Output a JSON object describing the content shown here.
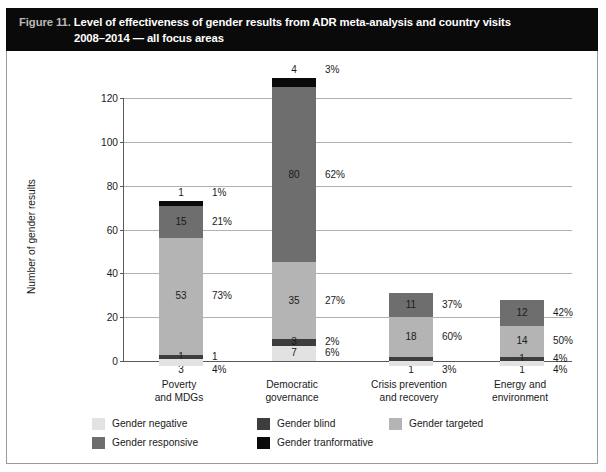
{
  "figure": {
    "number": "Figure 11.",
    "title_line1": "Level of effectiveness of gender results from ADR meta-analysis and country visits",
    "title_line2": "2008–2014 — all focus areas"
  },
  "chart_data": {
    "type": "bar",
    "subtype": "stacked-vertical",
    "title": "Level of effectiveness of gender results from ADR meta-analysis and country visits 2008–2014 — all focus areas",
    "xlabel": "",
    "ylabel": "Number of gender results",
    "ylim": [
      0,
      120
    ],
    "yticks": [
      "0",
      "20",
      "40",
      "60",
      "80",
      "100",
      "120"
    ],
    "grid": true,
    "legend_position": "bottom-left",
    "categories": [
      "Poverty\nand MDGs",
      "Democratic\ngovernance",
      "Crisis prevention\nand recovery",
      "Energy and\nenvironment"
    ],
    "category_lines": [
      [
        "Poverty",
        "and MDGs"
      ],
      [
        "Democratic",
        "governance"
      ],
      [
        "Crisis prevention",
        "and recovery"
      ],
      [
        "Energy and",
        "environment"
      ]
    ],
    "series": [
      {
        "name": "Gender negative",
        "color": "#e2e2e2",
        "values": [
          3,
          7,
          1,
          1
        ],
        "percents": [
          "4%",
          "6%",
          "3%",
          "4%"
        ]
      },
      {
        "name": "Gender blind",
        "color": "#3d3d3d",
        "values": [
          1,
          3,
          1,
          1
        ],
        "percents": [
          "1",
          "2%",
          "3%",
          "4%"
        ]
      },
      {
        "name": "Gender targeted",
        "color": "#b4b4b4",
        "values": [
          53,
          35,
          18,
          14
        ],
        "percents": [
          "73%",
          "27%",
          "60%",
          "50%"
        ]
      },
      {
        "name": "Gender responsive",
        "color": "#6e6e6e",
        "values": [
          15,
          80,
          11,
          12
        ],
        "percents": [
          "21%",
          "62%",
          "37%",
          "42%"
        ]
      },
      {
        "name": "Gender tranformative",
        "color": "#0a0a0a",
        "values": [
          1,
          4,
          0,
          0
        ],
        "percents": [
          "1%",
          "3%",
          "",
          ""
        ]
      }
    ],
    "totals": [
      73,
      129,
      31,
      28
    ],
    "bars": [
      {
        "category": "Poverty and MDGs",
        "segments": [
          {
            "series": "Gender negative",
            "value": 3,
            "percent": "4%",
            "label_position": "below-axis"
          },
          {
            "series": "Gender blind",
            "value": 1,
            "percent": "1",
            "label_position": "inside"
          },
          {
            "series": "Gender targeted",
            "value": 53,
            "percent": "73%",
            "label_position": "inside"
          },
          {
            "series": "Gender responsive",
            "value": 15,
            "percent": "21%",
            "label_position": "inside"
          },
          {
            "series": "Gender tranformative",
            "value": 1,
            "percent": "1%",
            "label_position": "above"
          }
        ]
      },
      {
        "category": "Democratic governance",
        "segments": [
          {
            "series": "Gender negative",
            "value": 7,
            "percent": "6%",
            "label_position": "inside"
          },
          {
            "series": "Gender blind",
            "value": 3,
            "percent": "2%",
            "label_position": "inside"
          },
          {
            "series": "Gender targeted",
            "value": 35,
            "percent": "27%",
            "label_position": "inside"
          },
          {
            "series": "Gender responsive",
            "value": 80,
            "percent": "62%",
            "label_position": "inside"
          },
          {
            "series": "Gender tranformative",
            "value": 4,
            "percent": "3%",
            "label_position": "above"
          }
        ]
      },
      {
        "category": "Crisis prevention and recovery",
        "segments": [
          {
            "series": "Gender negative",
            "value": 1,
            "percent": "3%",
            "label_position": "below-axis"
          },
          {
            "series": "Gender blind",
            "value": 1,
            "percent": "",
            "label_position": "none"
          },
          {
            "series": "Gender targeted",
            "value": 18,
            "percent": "60%",
            "label_position": "inside"
          },
          {
            "series": "Gender responsive",
            "value": 11,
            "percent": "37%",
            "label_position": "inside"
          }
        ]
      },
      {
        "category": "Energy and environment",
        "segments": [
          {
            "series": "Gender negative",
            "value": 1,
            "percent": "4%",
            "label_position": "below-axis"
          },
          {
            "series": "Gender blind",
            "value": 1,
            "percent": "4%",
            "label_position": "inside"
          },
          {
            "series": "Gender targeted",
            "value": 14,
            "percent": "50%",
            "label_position": "inside"
          },
          {
            "series": "Gender responsive",
            "value": 12,
            "percent": "42%",
            "label_position": "inside"
          }
        ]
      }
    ],
    "legend": [
      {
        "label": "Gender negative",
        "color": "#e2e2e2"
      },
      {
        "label": "Gender blind",
        "color": "#3d3d3d"
      },
      {
        "label": "Gender targeted",
        "color": "#b4b4b4"
      },
      {
        "label": "Gender responsive",
        "color": "#6e6e6e"
      },
      {
        "label": "Gender tranformative",
        "color": "#0a0a0a"
      }
    ]
  },
  "axis": {
    "y_title": "Number of gender results",
    "y_ticks": [
      "120",
      "100",
      "80",
      "60",
      "40",
      "20",
      "0"
    ]
  },
  "colors": {
    "title_band": "#0a0a0a",
    "figure_number": "#b9b9b9",
    "grid": "#b0b0b0",
    "axis": "#5a5a5a",
    "frame": "#9a9a9a"
  }
}
